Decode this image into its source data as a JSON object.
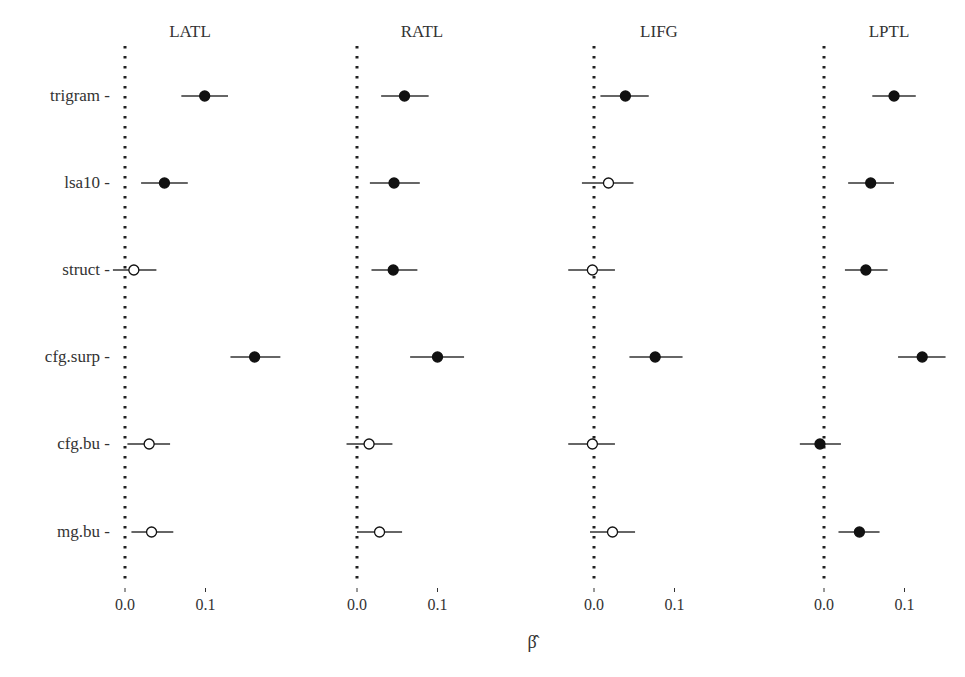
{
  "chart_data": {
    "type": "forest",
    "title": "",
    "xlabel": "β̂",
    "ylabel": "",
    "panels": [
      "LATL",
      "RATL",
      "LIFG",
      "LPTL"
    ],
    "categories": [
      "trigram",
      "lsa10",
      "struct",
      "cfg.surp",
      "cfg.bu",
      "mg.bu"
    ],
    "x_ticks": [
      0.0,
      0.1
    ],
    "x_tick_labels": [
      "0.0",
      "0.1"
    ],
    "reference_line": 0.0,
    "legend": "filled = CI excludes zero; open = CI includes zero",
    "series": [
      {
        "name": "LATL",
        "points": [
          {
            "category": "trigram",
            "estimate": 0.099,
            "lower": 0.07,
            "upper": 0.128,
            "filled": true
          },
          {
            "category": "lsa10",
            "estimate": 0.049,
            "lower": 0.02,
            "upper": 0.078,
            "filled": true
          },
          {
            "category": "struct",
            "estimate": 0.011,
            "lower": -0.015,
            "upper": 0.039,
            "filled": false
          },
          {
            "category": "cfg.surp",
            "estimate": 0.161,
            "lower": 0.131,
            "upper": 0.193,
            "filled": true
          },
          {
            "category": "cfg.bu",
            "estimate": 0.03,
            "lower": 0.003,
            "upper": 0.056,
            "filled": false
          },
          {
            "category": "mg.bu",
            "estimate": 0.033,
            "lower": 0.008,
            "upper": 0.06,
            "filled": false
          }
        ]
      },
      {
        "name": "RATL",
        "points": [
          {
            "category": "trigram",
            "estimate": 0.059,
            "lower": 0.03,
            "upper": 0.089,
            "filled": true
          },
          {
            "category": "lsa10",
            "estimate": 0.046,
            "lower": 0.016,
            "upper": 0.078,
            "filled": true
          },
          {
            "category": "struct",
            "estimate": 0.045,
            "lower": 0.018,
            "upper": 0.075,
            "filled": true
          },
          {
            "category": "cfg.surp",
            "estimate": 0.1,
            "lower": 0.066,
            "upper": 0.133,
            "filled": true
          },
          {
            "category": "cfg.bu",
            "estimate": 0.015,
            "lower": -0.013,
            "upper": 0.044,
            "filled": false
          },
          {
            "category": "mg.bu",
            "estimate": 0.028,
            "lower": 0.0,
            "upper": 0.056,
            "filled": false
          }
        ]
      },
      {
        "name": "LIFG",
        "points": [
          {
            "category": "trigram",
            "estimate": 0.039,
            "lower": 0.008,
            "upper": 0.068,
            "filled": true
          },
          {
            "category": "lsa10",
            "estimate": 0.018,
            "lower": -0.015,
            "upper": 0.049,
            "filled": false
          },
          {
            "category": "struct",
            "estimate": -0.002,
            "lower": -0.032,
            "upper": 0.026,
            "filled": false
          },
          {
            "category": "cfg.surp",
            "estimate": 0.076,
            "lower": 0.044,
            "upper": 0.11,
            "filled": true
          },
          {
            "category": "cfg.bu",
            "estimate": -0.002,
            "lower": -0.032,
            "upper": 0.026,
            "filled": false
          },
          {
            "category": "mg.bu",
            "estimate": 0.023,
            "lower": -0.005,
            "upper": 0.051,
            "filled": false
          }
        ]
      },
      {
        "name": "LPTL",
        "points": [
          {
            "category": "trigram",
            "estimate": 0.087,
            "lower": 0.06,
            "upper": 0.114,
            "filled": true
          },
          {
            "category": "lsa10",
            "estimate": 0.058,
            "lower": 0.03,
            "upper": 0.087,
            "filled": true
          },
          {
            "category": "struct",
            "estimate": 0.052,
            "lower": 0.026,
            "upper": 0.079,
            "filled": true
          },
          {
            "category": "cfg.surp",
            "estimate": 0.122,
            "lower": 0.092,
            "upper": 0.151,
            "filled": true
          },
          {
            "category": "cfg.bu",
            "estimate": -0.005,
            "lower": -0.03,
            "upper": 0.021,
            "filled": true
          },
          {
            "category": "mg.bu",
            "estimate": 0.044,
            "lower": 0.018,
            "upper": 0.069,
            "filled": true
          }
        ]
      }
    ],
    "grid": false,
    "legend_position": "none"
  },
  "colors": {
    "text": "#333333",
    "point_fill": "#111111",
    "point_open": "#ffffff",
    "ci_line": "#333333",
    "ref_line": "#222222"
  }
}
